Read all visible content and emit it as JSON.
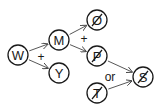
{
  "diagram": {
    "type": "reaction-graph",
    "stroke_color": "#1a1a1a",
    "nodes": [
      {
        "id": "W",
        "label": "W",
        "cx": 18,
        "cy": 55,
        "struck": false
      },
      {
        "id": "M",
        "label": "M",
        "cx": 59,
        "cy": 40,
        "struck": false
      },
      {
        "id": "Y",
        "label": "Y",
        "cx": 59,
        "cy": 73,
        "struck": false
      },
      {
        "id": "O",
        "label": "O",
        "cx": 97,
        "cy": 20,
        "struck": true
      },
      {
        "id": "P",
        "label": "P",
        "cx": 97,
        "cy": 56,
        "struck": true
      },
      {
        "id": "T",
        "label": "T",
        "cx": 97,
        "cy": 93,
        "struck": true
      },
      {
        "id": "S",
        "label": "S",
        "cx": 143,
        "cy": 77,
        "struck": true
      }
    ],
    "edges": [
      {
        "from": "W",
        "to": "M"
      },
      {
        "from": "W",
        "to": "Y"
      },
      {
        "from": "M",
        "to": "O"
      },
      {
        "from": "M",
        "to": "P"
      },
      {
        "from": "P",
        "to": "S"
      },
      {
        "from": "T",
        "to": "S"
      }
    ],
    "operators": [
      {
        "label": "+",
        "x": 41,
        "y": 57,
        "between": [
          "M",
          "Y"
        ]
      },
      {
        "label": "+",
        "x": 84,
        "y": 39,
        "between": [
          "O",
          "P"
        ]
      },
      {
        "label": "or",
        "x": 110,
        "y": 77,
        "between": [
          "P",
          "T"
        ]
      }
    ]
  }
}
